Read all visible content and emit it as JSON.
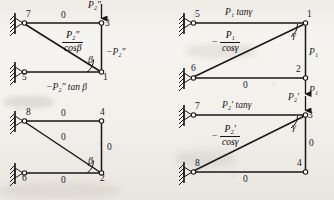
{
  "figure": {
    "title": "",
    "type": "structural-frame-diagram",
    "panels": [
      {
        "id": "top-left",
        "nodes": [
          {
            "name": "node-7",
            "label": "7",
            "support": "fixed-hinge"
          },
          {
            "name": "node-3",
            "label": "3",
            "support": "free"
          },
          {
            "name": "node-5",
            "label": "5",
            "support": "fixed-hinge"
          },
          {
            "name": "node-1",
            "label": "1",
            "support": "free"
          }
        ],
        "top_member_value": "0",
        "bottom_member_value": "",
        "diagonal_numerator": "P₂″",
        "diagonal_denominator": "cosβ",
        "diagonal_sign": "",
        "right_member_value": "−P₂″",
        "bottom_label": "−P₂″ tan β",
        "angle_label": "β",
        "load_label": "P₂″",
        "load_direction": "down",
        "load_at_node": "3"
      },
      {
        "id": "bottom-left",
        "nodes": [
          {
            "name": "node-8",
            "label": "8",
            "support": "fixed-hinge"
          },
          {
            "name": "node-4",
            "label": "4",
            "support": "free"
          },
          {
            "name": "node-6",
            "label": "6",
            "support": "fixed-hinge"
          },
          {
            "name": "node-2",
            "label": "2",
            "support": "free"
          }
        ],
        "top_member_value": "0",
        "diagonal_value": "0",
        "right_member_value": "0",
        "bottom_member_value": "0",
        "angle_label": "β",
        "load_label": "",
        "load_direction": "none"
      },
      {
        "id": "top-right",
        "nodes": [
          {
            "name": "node-5",
            "label": "5",
            "support": "fixed-hinge"
          },
          {
            "name": "node-1",
            "label": "1",
            "support": "free"
          },
          {
            "name": "node-6",
            "label": "6",
            "support": "fixed-hinge"
          },
          {
            "name": "node-2",
            "label": "2",
            "support": "free"
          }
        ],
        "top_member_value": "P₁ tanγ",
        "diagonal_numerator": "P₁",
        "diagonal_denominator": "cosγ",
        "diagonal_sign": "−",
        "right_member_value": "P₁",
        "bottom_member_value": "0",
        "angle_label": "γ",
        "load_label": "P₁",
        "load_direction": "down",
        "load_at_node": "2"
      },
      {
        "id": "bottom-right",
        "nodes": [
          {
            "name": "node-7",
            "label": "7",
            "support": "fixed-hinge"
          },
          {
            "name": "node-3",
            "label": "3",
            "support": "free"
          },
          {
            "name": "node-8",
            "label": "8",
            "support": "fixed-hinge"
          },
          {
            "name": "node-4",
            "label": "4",
            "support": "free"
          }
        ],
        "top_member_value": "P₂′ tanγ",
        "diagonal_numerator": "P₂′",
        "diagonal_denominator": "cosγ",
        "diagonal_sign": "−",
        "right_member_value": "0",
        "bottom_member_value": "0",
        "angle_label": "γ",
        "load_label": "P₂′",
        "load_direction": "down",
        "load_at_node": "3"
      }
    ],
    "colors": {
      "ink": "#17171a",
      "paper": "#f2f0ec"
    }
  },
  "labels": {
    "tl_node_7": "7",
    "tl_node_3": "3",
    "tl_node_5": "5",
    "tl_node_1": "1",
    "tl_top_zero": "0",
    "tl_right_force": "−P₂″",
    "tl_bottom_force": "−P₂″ tan β",
    "tl_angle": "β",
    "tl_load": "P₂″",
    "tl_frac_num": "P₂″",
    "tl_frac_den": "cosβ",
    "bl_node_8": "8",
    "bl_node_4": "4",
    "bl_node_6": "6",
    "bl_node_2": "2",
    "bl_top_zero": "0",
    "bl_diag_zero": "0",
    "bl_right_zero": "0",
    "bl_bottom_zero": "0",
    "bl_angle": "β",
    "tr_node_5": "5",
    "tr_node_1": "1",
    "tr_node_6": "6",
    "tr_node_2": "2",
    "tr_top_force": "P₁ tanγ",
    "tr_frac_sign": "−",
    "tr_frac_num": "P₁",
    "tr_frac_den": "cosγ",
    "tr_right_force": "P₁",
    "tr_bottom_zero": "0",
    "tr_angle": "γ",
    "tr_load": "P₁",
    "br_node_7": "7",
    "br_node_3": "3",
    "br_node_8": "8",
    "br_node_4": "4",
    "br_top_force": "P₂′ tanγ",
    "br_frac_sign": "−",
    "br_frac_num": "P₂′",
    "br_frac_den": "cosγ",
    "br_right_zero": "0",
    "br_bottom_zero": "0",
    "br_angle": "γ",
    "br_load": "P₂′"
  }
}
